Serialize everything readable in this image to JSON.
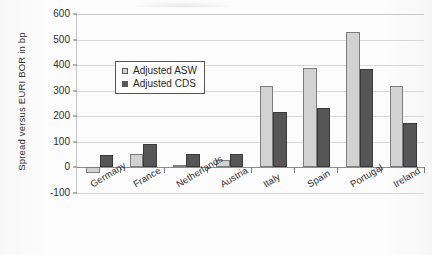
{
  "chart_data": {
    "type": "bar",
    "title": "",
    "xlabel": "",
    "ylabel": "Spread versus EURI BOR in bp",
    "ylim": [
      -100,
      600
    ],
    "yticks": [
      600,
      500,
      400,
      300,
      200,
      100,
      0,
      -100
    ],
    "ytick_labels": [
      "600",
      "500",
      "400",
      "300",
      "200",
      "100",
      "0",
      "-100"
    ],
    "grid": true,
    "legend_position": "upper-left-inside",
    "categories": [
      "Germany",
      "France",
      "Netherlands",
      "Austria",
      "Italy",
      "Spain",
      "Portugal",
      "Ireland"
    ],
    "series": [
      {
        "name": "Adjusted ASW",
        "color": "#d2d2d2",
        "values": [
          -20,
          52,
          8,
          30,
          320,
          388,
          530,
          318
        ]
      },
      {
        "name": "Adjusted CDS",
        "color": "#565656",
        "values": [
          50,
          90,
          52,
          52,
          215,
          232,
          383,
          175
        ]
      }
    ]
  },
  "legend": {
    "entries": [
      {
        "label": "Adjusted ASW",
        "swatch": "asw"
      },
      {
        "label": "Adjusted CDS",
        "swatch": "cds"
      }
    ]
  },
  "axis": {
    "y_title": "Spread versus EURI BOR in bp"
  }
}
